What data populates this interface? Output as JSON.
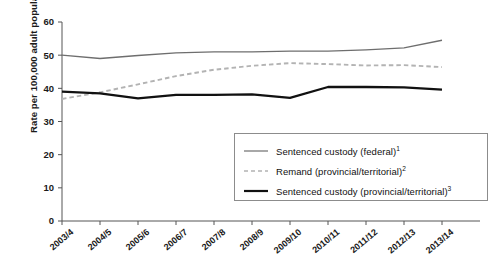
{
  "chart_data": {
    "type": "line",
    "title": "",
    "xlabel": "",
    "ylabel": "Rate per 100,000 adult population",
    "ylim": [
      0,
      60
    ],
    "yticks": [
      0,
      10,
      20,
      30,
      40,
      50,
      60
    ],
    "grid": false,
    "legend_position": "inside-bottom-right",
    "categories": [
      "2003/4",
      "2004/5",
      "2005/6",
      "2006/7",
      "2007/8",
      "2008/9",
      "2009/10",
      "2010/11",
      "2011/12",
      "2012/13",
      "2013/14"
    ],
    "series": [
      {
        "name": "Sentenced custody (federal)",
        "footnote": "1",
        "style": "solid-thin-gray",
        "color": "#6e6e6e",
        "values": [
          50.0,
          49.0,
          49.9,
          50.7,
          51.0,
          51.0,
          51.2,
          51.2,
          51.6,
          52.2,
          54.5
        ]
      },
      {
        "name": "Remand (provincial/territorial)",
        "footnote": "2",
        "style": "dashed-light-gray",
        "color": "#b3b3b3",
        "values": [
          36.8,
          38.8,
          41.2,
          43.7,
          45.6,
          46.8,
          47.6,
          47.3,
          46.9,
          47.0,
          46.4
        ]
      },
      {
        "name": "Sentenced custody (provincial/territorial)",
        "footnote": "3",
        "style": "solid-thick-black",
        "color": "#111111",
        "values": [
          39.0,
          38.5,
          37.0,
          38.0,
          38.0,
          38.2,
          37.1,
          40.4,
          40.4,
          40.3,
          39.6
        ]
      }
    ]
  },
  "axis": {
    "y_label": "Rate per 100,000 adult population",
    "y_tick_labels": [
      "0",
      "10",
      "20",
      "30",
      "40",
      "50",
      "60"
    ],
    "x_tick_labels": [
      "2003/4",
      "2004/5",
      "2005/6",
      "2006/7",
      "2007/8",
      "2008/9",
      "2009/10",
      "2010/11",
      "2011/12",
      "2012/13",
      "2013/14"
    ]
  },
  "legend": {
    "items": [
      {
        "label": "Sentenced custody (federal)",
        "sup": "1",
        "swatch": "line-solid-thin-gray"
      },
      {
        "label": "Remand (provincial/territorial)",
        "sup": "2",
        "swatch": "line-dashed-gray"
      },
      {
        "label": "Sentenced custody (provincial/territorial)",
        "sup": "3",
        "swatch": "line-solid-thick-black"
      }
    ]
  },
  "colors": {
    "federal": "#6e6e6e",
    "remand": "#b3b3b3",
    "provincial": "#111111",
    "axis": "#555555",
    "text": "#1a1a1a"
  }
}
